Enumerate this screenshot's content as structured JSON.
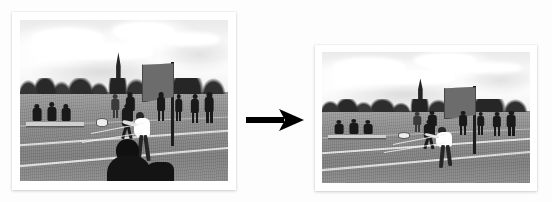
{
  "figure": {
    "title": "Image downscaling illustration",
    "description": "A framed grayscale photograph of a school sports field on the left, a black right-pointing arrow in the middle, and the same photograph at reduced size on the right.",
    "background_color": "#fdfdfd"
  },
  "panels": [
    {
      "id": "source-photo",
      "role": "source",
      "label": "Original photograph",
      "frame_color": "#ffffff",
      "position": {
        "x": 12,
        "y": 12,
        "width": 224,
        "height": 178
      },
      "scene": {
        "subject": "Outdoor sports field with players, a flag banner and spectators on a bench",
        "tone": "grayscale",
        "sky": "overcast with bright clouds",
        "treeline": "row of dark trees with a church steeple behind",
        "flag": "large dark banner on a pole, right of centre",
        "foreground": "player in white shirt bending forward, dark blurred figure at bottom"
      }
    },
    {
      "id": "result-photo",
      "role": "result",
      "label": "Resized photograph",
      "frame_color": "#ffffff",
      "position": {
        "x": 315,
        "y": 45,
        "width": 222,
        "height": 146
      },
      "scene": {
        "subject": "Outdoor sports field with players, a flag banner and spectators on a bench",
        "tone": "grayscale",
        "sky": "overcast with bright clouds",
        "treeline": "row of dark trees with a church steeple behind",
        "flag": "large dark banner on a pole, right of centre",
        "foreground": "player in white shirt bending forward"
      }
    }
  ],
  "arrow": {
    "name": "transformation-arrow",
    "direction": "right",
    "color": "#000000",
    "position": {
      "x": 246,
      "y": 106,
      "width": 60,
      "height": 28
    }
  }
}
